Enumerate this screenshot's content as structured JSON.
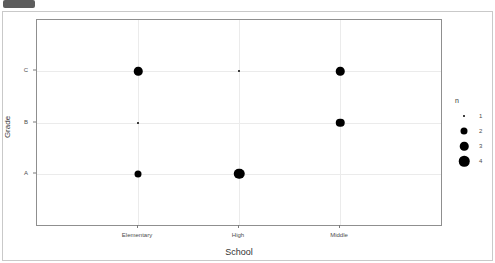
{
  "toolbar": {
    "badge_label": ""
  },
  "chart_data": {
    "type": "scatter",
    "title": "",
    "xlabel": "School",
    "ylabel": "Grade",
    "x_categories": [
      "Elementary",
      "High",
      "Middle"
    ],
    "y_categories": [
      "A",
      "B",
      "C"
    ],
    "grid": true,
    "legend": {
      "title": "n",
      "position": "right",
      "entries": [
        {
          "label": "1",
          "size_px": 2
        },
        {
          "label": "2",
          "size_px": 7
        },
        {
          "label": "3",
          "size_px": 8.5
        },
        {
          "label": "4",
          "size_px": 10.5
        }
      ]
    },
    "size_encoding": "n",
    "color": "#000000",
    "points": [
      {
        "school": "Elementary",
        "grade": "C",
        "n": 3,
        "size_px": 8.5
      },
      {
        "school": "High",
        "grade": "C",
        "n": 1,
        "size_px": 2
      },
      {
        "school": "Middle",
        "grade": "C",
        "n": 3,
        "size_px": 8.5
      },
      {
        "school": "Elementary",
        "grade": "B",
        "n": 1,
        "size_px": 2
      },
      {
        "school": "Middle",
        "grade": "B",
        "n": 3,
        "size_px": 8.5
      },
      {
        "school": "Elementary",
        "grade": "A",
        "n": 2,
        "size_px": 7
      },
      {
        "school": "High",
        "grade": "A",
        "n": 4,
        "size_px": 10.5
      }
    ]
  }
}
